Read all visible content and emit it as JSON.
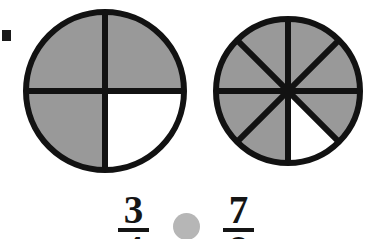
{
  "worksheet": {
    "type": "fraction-comparison-problem",
    "width": 372,
    "height": 239,
    "background_color": "#ffffff",
    "margin_mark": "margin-tick-mark"
  },
  "colors": {
    "shaded_sector": "#999999",
    "unshaded_sector": "#ffffff",
    "outline": "#121212",
    "answer_slot": "#b6b6b6",
    "text": "#151515"
  },
  "models": [
    {
      "name": "fraction-circle-three-fourths",
      "total_parts": 4,
      "shaded_parts": 3,
      "fraction_label": "3/4",
      "center_x": 105,
      "center_y": 91,
      "radius": 79,
      "stroke_width": 6,
      "start_angle_deg": -90,
      "unshaded_sector_indices": [
        1
      ]
    },
    {
      "name": "fraction-circle-seven-eighths",
      "total_parts": 8,
      "shaded_parts": 7,
      "fraction_label": "7/8",
      "center_x": 288,
      "center_y": 91,
      "radius": 72,
      "stroke_width": 6,
      "start_angle_deg": -90,
      "unshaded_sector_indices": [
        3
      ]
    }
  ],
  "expression": {
    "left_fraction": {
      "name": "left-fraction",
      "numerator": "3",
      "denominator": "4"
    },
    "operator_slot": {
      "name": "comparison-answer-slot",
      "value": "",
      "shape": "circle"
    },
    "right_fraction": {
      "name": "right-fraction",
      "numerator": "7",
      "denominator": "8"
    }
  }
}
